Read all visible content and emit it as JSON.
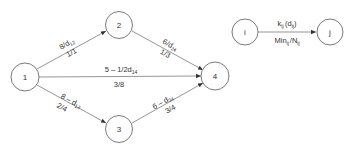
{
  "diagram": {
    "type": "network-flow",
    "nodes": [
      {
        "id": "1",
        "label": "1",
        "x": 25,
        "y": 77
      },
      {
        "id": "2",
        "label": "2",
        "x": 119,
        "y": 25
      },
      {
        "id": "3",
        "label": "3",
        "x": 119,
        "y": 129
      },
      {
        "id": "4",
        "label": "4",
        "x": 215,
        "y": 76
      }
    ],
    "edges": [
      {
        "from": "1",
        "to": "2",
        "top": {
          "main": "8/d",
          "sub": "12"
        },
        "bottom": "1/1"
      },
      {
        "from": "2",
        "to": "4",
        "top": {
          "main": "6/d",
          "sub": "24"
        },
        "bottom": "1/3"
      },
      {
        "from": "1",
        "to": "4",
        "top": {
          "main": "5 – 1/2d",
          "sub": "14"
        },
        "bottom": "3/8"
      },
      {
        "from": "1",
        "to": "3",
        "top": {
          "main": "8 – d",
          "sub": "13"
        },
        "bottom": "2/4"
      },
      {
        "from": "3",
        "to": "4",
        "top": {
          "main": "6 – d",
          "sub": "34"
        },
        "bottom": "3/4"
      }
    ],
    "legend": {
      "node_from": "i",
      "node_to": "j",
      "top": {
        "k": "k",
        "k_sub": "ij",
        "d": "(d",
        "d_sub": "ij",
        "close": ")"
      },
      "bottom": {
        "min": "Min",
        "min_sub": "ij",
        "slash": "/N",
        "n_sub": "ij"
      }
    }
  }
}
